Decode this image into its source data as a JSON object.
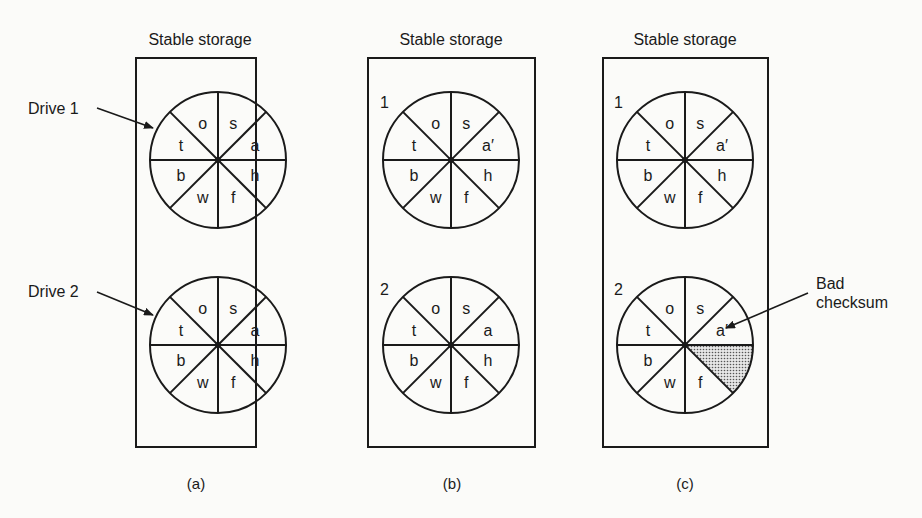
{
  "panels": [
    {
      "title": "Stable storage",
      "caption": "(a)",
      "drives": [
        {
          "label": "Drive 1",
          "labelStyle": "callout",
          "sectors": [
            "s",
            "a",
            "h",
            "f",
            "w",
            "b",
            "t",
            "o"
          ],
          "bad_sector": null
        },
        {
          "label": "Drive 2",
          "labelStyle": "callout",
          "sectors": [
            "s",
            "a",
            "h",
            "f",
            "w",
            "b",
            "t",
            "o"
          ],
          "bad_sector": null
        }
      ]
    },
    {
      "title": "Stable storage",
      "caption": "(b)",
      "drives": [
        {
          "label": "1",
          "labelStyle": "inline",
          "sectors": [
            "s",
            "a′",
            "h",
            "f",
            "w",
            "b",
            "t",
            "o"
          ],
          "bad_sector": null
        },
        {
          "label": "2",
          "labelStyle": "inline",
          "sectors": [
            "s",
            "a",
            "h",
            "f",
            "w",
            "b",
            "t",
            "o"
          ],
          "bad_sector": null
        }
      ]
    },
    {
      "title": "Stable storage",
      "caption": "(c)",
      "drives": [
        {
          "label": "1",
          "labelStyle": "inline",
          "sectors": [
            "s",
            "a′",
            "h",
            "f",
            "w",
            "b",
            "t",
            "o"
          ],
          "bad_sector": null
        },
        {
          "label": "2",
          "labelStyle": "inline",
          "sectors": [
            "s",
            "a′",
            "",
            "f",
            "w",
            "b",
            "t",
            "o"
          ],
          "bad_sector": 2
        }
      ]
    }
  ],
  "annotation": {
    "line1": "Bad",
    "line2": "checksum"
  },
  "colors": {
    "stroke": "#1a1a1a",
    "background": "#fbfbf9",
    "bad_fill": "#b9b9b9"
  }
}
